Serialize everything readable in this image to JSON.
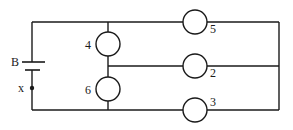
{
  "diagram": {
    "type": "electric-circuit",
    "battery": {
      "label": "B"
    },
    "switch_point": {
      "label": "x"
    },
    "bulbs": [
      {
        "id": "4",
        "label": "4"
      },
      {
        "id": "6",
        "label": "6"
      },
      {
        "id": "5",
        "label": "5"
      },
      {
        "id": "2",
        "label": "2"
      },
      {
        "id": "3",
        "label": "3"
      }
    ]
  }
}
